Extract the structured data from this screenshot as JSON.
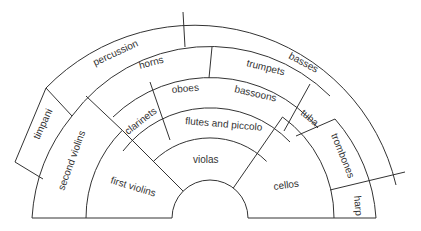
{
  "diagram": {
    "title": "",
    "type": "orchestra seating plan",
    "sections": [
      {
        "id": "first-violins",
        "label": "first violins"
      },
      {
        "id": "second-violins",
        "label": "second violins"
      },
      {
        "id": "violas",
        "label": "violas"
      },
      {
        "id": "cellos",
        "label": "cellos"
      },
      {
        "id": "basses",
        "label": "basses"
      },
      {
        "id": "flutes-and-piccolo",
        "label": "flutes and piccolo"
      },
      {
        "id": "oboes",
        "label": "oboes"
      },
      {
        "id": "clarinets",
        "label": "clarinets"
      },
      {
        "id": "bassoons",
        "label": "bassoons"
      },
      {
        "id": "horns",
        "label": "horns"
      },
      {
        "id": "trumpets",
        "label": "trumpets"
      },
      {
        "id": "trombones",
        "label": "trombones"
      },
      {
        "id": "tuba",
        "label": "tuba"
      },
      {
        "id": "timpani",
        "label": "timpani"
      },
      {
        "id": "percussion",
        "label": "percussion"
      },
      {
        "id": "harp",
        "label": "harp"
      }
    ],
    "colors": {
      "line": "#333333",
      "background": "#ffffff",
      "text": "#333333"
    }
  }
}
